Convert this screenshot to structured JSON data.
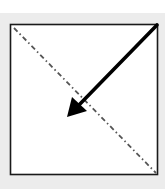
{
  "diagram": {
    "title": "",
    "colors": {
      "page_background": "#ffffff",
      "panel_background": "#ececec",
      "box_fill": "#ffffff",
      "box_stroke": "#1a1a1a",
      "diagonal_stroke": "#555555",
      "arrow_color": "#000000"
    },
    "box": {
      "x": 10,
      "y": 24,
      "width": 148,
      "height": 151
    },
    "diagonal": {
      "style": "dash-dot",
      "from": {
        "x": 14,
        "y": 28
      },
      "to": {
        "x": 156,
        "y": 173
      }
    },
    "arrow": {
      "from": {
        "x": 157,
        "y": 25
      },
      "to": {
        "x": 67,
        "y": 117
      },
      "direction": "toward center-left (down-left)"
    }
  }
}
